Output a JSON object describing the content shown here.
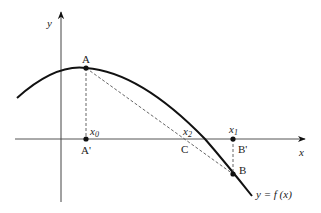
{
  "diagram": {
    "type": "newton-method-geometry",
    "axes": {
      "x_label": "x",
      "y_label": "y"
    },
    "curve": {
      "label": "y = f (x)"
    },
    "points": {
      "A": "A",
      "A_prime": "A'",
      "B": "B",
      "B_prime": "B'",
      "C": "C"
    },
    "x_marks": {
      "x0_base": "x",
      "x0_sub": "0",
      "x1_base": "x",
      "x1_sub": "1",
      "x2_base": "x",
      "x2_sub": "2"
    },
    "colors": {
      "stroke": "#111111",
      "axis": "#444444",
      "dashed": "#555555"
    }
  }
}
